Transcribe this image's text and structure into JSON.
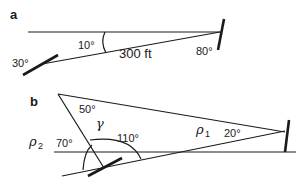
{
  "panels": {
    "a": {
      "label": "a",
      "angles": {
        "left_marker": "30°",
        "vertex": "10°",
        "right_marker": "80°"
      },
      "distance": "300 ft"
    },
    "b": {
      "label": "b",
      "angles": {
        "apex": "50°",
        "left": "70°",
        "right": "110°",
        "far_right": "20°"
      },
      "symbols": {
        "gamma": "γ",
        "rho1_base": "ρ",
        "rho1_sub": "1",
        "rho2_base": "ρ",
        "rho2_sub": "2"
      }
    }
  },
  "colors": {
    "line": "#1a1a1a",
    "background": "#ffffff"
  }
}
